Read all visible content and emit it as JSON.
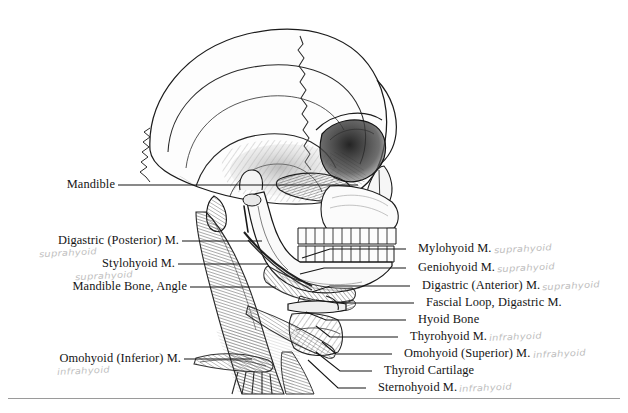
{
  "figure": {
    "background_color": "#ffffff",
    "ink_color": "#141414",
    "annotation_color": "#bcbcbc"
  },
  "labels_left": [
    {
      "id": "mandible",
      "text": "Mandible",
      "note": ""
    },
    {
      "id": "digastric-posterior",
      "text": "Digastric (Posterior) M.",
      "note": "suprahyoid"
    },
    {
      "id": "stylohyoid",
      "text": "Stylohyoid M.",
      "note": "suprahyoid"
    },
    {
      "id": "mandible-bone-angle",
      "text": "Mandible Bone, Angle",
      "note": ""
    },
    {
      "id": "omohyoid-inferior",
      "text": "Omohyoid (Inferior) M.",
      "note": "infrahyoid"
    }
  ],
  "labels_right": [
    {
      "id": "mylohyoid",
      "text": "Mylohyoid M.",
      "note": "suprahyoid"
    },
    {
      "id": "geniohyoid",
      "text": "Geniohyoid M.",
      "note": "suprahyoid"
    },
    {
      "id": "digastric-anterior",
      "text": "Digastric (Anterior) M.",
      "note": "suprahyoid"
    },
    {
      "id": "fascial-loop",
      "text": "Fascial Loop, Digastric M.",
      "note": ""
    },
    {
      "id": "hyoid-bone",
      "text": "Hyoid Bone",
      "note": ""
    },
    {
      "id": "thyrohyoid",
      "text": "Thyrohyoid M.",
      "note": "infrahyoid"
    },
    {
      "id": "omohyoid-superior",
      "text": "Omohyoid (Superior) M.",
      "note": "infrahyoid"
    },
    {
      "id": "thyroid-cartilage",
      "text": "Thyroid Cartilage",
      "note": ""
    },
    {
      "id": "sternohyoid",
      "text": "Sternohyoid M.",
      "note": "infrahyoid"
    }
  ]
}
